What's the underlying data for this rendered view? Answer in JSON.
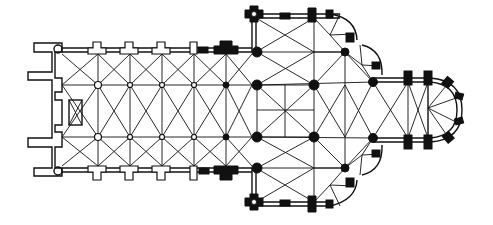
{
  "figure": {
    "type": "architectural-ground-plan",
    "parts": [
      "west-front",
      "nave",
      "side-aisles",
      "transept",
      "crossing",
      "choir",
      "apse",
      "transept-chapels"
    ],
    "colors": {
      "ink": "#111111",
      "background": "#ffffff"
    },
    "nave": {
      "bays": 6,
      "aisles": 3
    },
    "choir": {
      "bays": 2,
      "apse_sides": 5
    }
  }
}
